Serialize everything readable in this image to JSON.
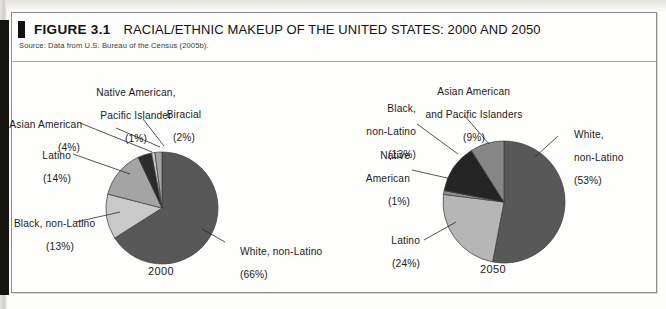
{
  "figure": {
    "number": "FIGURE 3.1",
    "title": "RACIAL/ETHNIC MAKEUP OF THE UNITED STATES: 2000 AND 2050",
    "source": "Source: Data from U.S. Bureau of the Census (2005b)."
  },
  "colors": {
    "white_non_latino": "#585858",
    "black_non_latino_2000": "#c9c9c9",
    "latino_2000": "#a4a4a4",
    "asian_american_2000": "#2b2b2b",
    "native_american_2000": "#c9c9c9",
    "biracial_2000": "#a4a4a4",
    "asian_2050": "#868686",
    "black_2050": "#242424",
    "native_2050": "#8f8f8f",
    "latino_2050": "#b6b6b6",
    "outline": "#3a3a3a",
    "text": "#1b1b1b"
  },
  "chart_data": [
    {
      "type": "pie",
      "title": "2000",
      "year_label": "2000",
      "categories": [
        "White, non-Latino",
        "Black, non-Latino",
        "Latino",
        "Asian American",
        "Native American, Pacific Islander",
        "Biracial"
      ],
      "values": [
        66,
        13,
        14,
        4,
        1,
        2
      ],
      "labels": [
        {
          "name": "White, non-Latino",
          "pct": "(66%)",
          "line1": "White, non-Latino",
          "line2": "(66%)"
        },
        {
          "name": "Black, non-Latino",
          "pct": "(13%)",
          "line1": "Black, non-Latino",
          "line2": "(13%)"
        },
        {
          "name": "Latino",
          "pct": "(14%)",
          "line1": "Latino",
          "line2": "(14%)"
        },
        {
          "name": "Asian American",
          "pct": "(4%)",
          "line1": "Asian American",
          "line2": "(4%)"
        },
        {
          "name": "Native American, Pacific Islander",
          "pct": "(1%)",
          "line1": "Native American,",
          "line2": "Pacific Islander",
          "line3": "(1%)"
        },
        {
          "name": "Biracial",
          "pct": "(2%)",
          "line1": "Biracial",
          "line2": "(2%)"
        }
      ]
    },
    {
      "type": "pie",
      "title": "2050",
      "year_label": "2050",
      "categories": [
        "White, non-Latino",
        "Latino",
        "Black, non-Latino",
        "Asian American and Pacific Islanders",
        "Native American"
      ],
      "values": [
        53,
        24,
        13,
        9,
        1
      ],
      "labels": [
        {
          "name": "White, non-Latino",
          "pct": "(53%)",
          "line1": "White,",
          "line2": "non-Latino",
          "line3": "(53%)"
        },
        {
          "name": "Latino",
          "pct": "(24%)",
          "line1": "Latino",
          "line2": "(24%)"
        },
        {
          "name": "Black, non-Latino",
          "pct": "(13%)",
          "line1": "Black,",
          "line2": "non-Latino",
          "line3": "(13%)"
        },
        {
          "name": "Asian American and Pacific Islanders",
          "pct": "(9%)",
          "line1": "Asian American",
          "line2": "and Pacific Islanders",
          "line3": "(9%)"
        },
        {
          "name": "Native American",
          "pct": "(1%)",
          "line1": "Native",
          "line2": "American",
          "line3": "(1%)"
        }
      ]
    }
  ]
}
